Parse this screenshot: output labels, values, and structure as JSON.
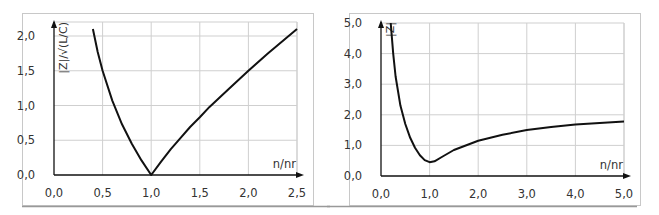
{
  "chart_data": [
    {
      "type": "line",
      "title": "",
      "xlabel": "n/nr",
      "ylabel": "|Z|/√(L/C)",
      "xlim": [
        0,
        2.5
      ],
      "ylim": [
        0,
        2.15
      ],
      "grid": true,
      "legend": null,
      "x_ticks": [
        "0,0",
        "0,5",
        "1,0",
        "1,5",
        "2,0",
        "2,5"
      ],
      "y_ticks": [
        "0,0",
        "0,5",
        "1,0",
        "1,5",
        "2,0"
      ],
      "series": [
        {
          "name": "|Z|/√(L/C)",
          "x": [
            0.4,
            0.45,
            0.5,
            0.6,
            0.7,
            0.8,
            0.9,
            1.0,
            1.1,
            1.2,
            1.3,
            1.4,
            1.5,
            1.6,
            1.8,
            2.0,
            2.2,
            2.5
          ],
          "values": [
            2.1,
            1.77,
            1.5,
            1.07,
            0.73,
            0.45,
            0.21,
            0.0,
            0.19,
            0.37,
            0.53,
            0.69,
            0.83,
            0.98,
            1.24,
            1.5,
            1.75,
            2.1
          ]
        }
      ]
    },
    {
      "type": "line",
      "title": "",
      "xlabel": "n/nr",
      "ylabel": "|Z|",
      "xlim": [
        0,
        5.0
      ],
      "ylim": [
        0,
        5.0
      ],
      "grid": true,
      "legend": null,
      "x_ticks": [
        "0,0",
        "1,0",
        "2,0",
        "3,0",
        "4,0",
        "5,0"
      ],
      "y_ticks": [
        "0,0",
        "1,0",
        "2,0",
        "3,0",
        "4,0",
        "5,0"
      ],
      "series": [
        {
          "name": "|Z|",
          "x": [
            0.2,
            0.25,
            0.3,
            0.4,
            0.5,
            0.6,
            0.7,
            0.8,
            0.9,
            1.0,
            1.1,
            1.25,
            1.5,
            2.0,
            2.5,
            3.0,
            3.5,
            4.0,
            4.5,
            5.0
          ],
          "values": [
            5.0,
            4.0,
            3.25,
            2.3,
            1.7,
            1.25,
            0.92,
            0.68,
            0.52,
            0.45,
            0.48,
            0.62,
            0.85,
            1.15,
            1.35,
            1.5,
            1.6,
            1.68,
            1.73,
            1.78
          ]
        }
      ]
    }
  ]
}
